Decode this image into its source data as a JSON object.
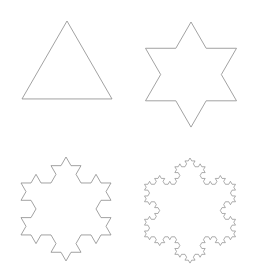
{
  "diagram": {
    "stroke_color": "#8a8a8a",
    "background": "#ffffff",
    "figures": [
      {
        "name": "koch-iteration-0",
        "level": 0,
        "apex": [
          67,
          21
        ],
        "side": 90
      },
      {
        "name": "koch-iteration-1",
        "level": 1,
        "apex": [
          191,
          22
        ],
        "side": 91
      },
      {
        "name": "koch-iteration-2",
        "level": 2,
        "apex": [
          66,
          157
        ],
        "side": 90
      },
      {
        "name": "koch-iteration-3",
        "level": 3,
        "apex": [
          190,
          158
        ],
        "side": 91
      }
    ]
  }
}
